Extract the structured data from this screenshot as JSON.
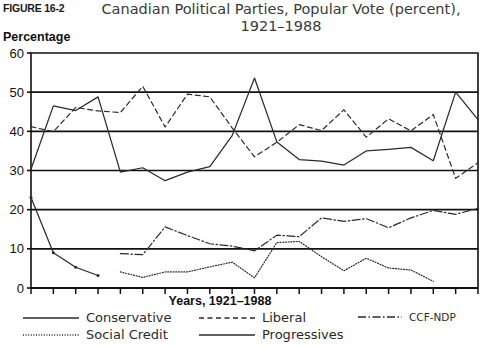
{
  "figure": {
    "number": "FIGURE 16-2",
    "title_line1": "Canadian Political Parties, Popular Vote (percent),",
    "title_line2": "1921–1988"
  },
  "axes": {
    "y_axis_label": "Percentage",
    "x_axis_label": "Years, 1921–1988",
    "y_ticks": [
      "0",
      "10",
      "20",
      "30",
      "40",
      "50",
      "60"
    ],
    "x_ticks": [
      "21",
      "25",
      "26",
      "30",
      "35",
      "40",
      "45",
      "49",
      "53",
      "57",
      "58",
      "62",
      "63",
      "65",
      "68",
      "72",
      "74",
      "79",
      "80",
      "84",
      "88"
    ]
  },
  "legend": {
    "items": [
      {
        "label": "Conservative",
        "style": "solid",
        "icon": "line-solid-icon"
      },
      {
        "label": "Social Credit",
        "style": "dotted",
        "icon": "line-dotted-icon"
      },
      {
        "label": "Liberal",
        "style": "dashed",
        "icon": "line-dashed-icon"
      },
      {
        "label": "Progressives",
        "style": "solid",
        "icon": "line-solid-icon"
      },
      {
        "label": "CCF-NDP",
        "style": "dashdot",
        "icon": "line-dashdot-icon"
      }
    ]
  },
  "chart_data": {
    "type": "line",
    "title": "Canadian Political Parties, Popular Vote (percent), 1921–1988",
    "xlabel": "Years, 1921–1988",
    "ylabel": "Percentage",
    "ylim": [
      0,
      60
    ],
    "ytick_step": 10,
    "grid": true,
    "legend_position": "bottom",
    "categories": [
      "21",
      "25",
      "26",
      "30",
      "35",
      "40",
      "45",
      "49",
      "53",
      "57",
      "58",
      "62",
      "63",
      "65",
      "68",
      "72",
      "74",
      "79",
      "80",
      "84",
      "88"
    ],
    "series": [
      {
        "name": "Conservative",
        "style": "solid",
        "color": "#2b2b2b",
        "x": [
          "21",
          "25",
          "26",
          "30",
          "35",
          "40",
          "45",
          "49",
          "53",
          "57",
          "58",
          "62",
          "63",
          "65",
          "68",
          "72",
          "74",
          "79",
          "80",
          "84",
          "88"
        ],
        "values": [
          30.3,
          46.5,
          45.3,
          48.8,
          29.6,
          30.7,
          27.4,
          29.6,
          31.0,
          38.9,
          53.6,
          37.3,
          32.8,
          32.4,
          31.4,
          35.0,
          35.4,
          35.9,
          32.5,
          50.0,
          43.0
        ]
      },
      {
        "name": "Liberal",
        "style": "dashed",
        "color": "#2b2b2b",
        "x": [
          "21",
          "25",
          "26",
          "30",
          "35",
          "40",
          "45",
          "49",
          "53",
          "57",
          "58",
          "62",
          "63",
          "65",
          "68",
          "72",
          "74",
          "79",
          "80",
          "84",
          "88"
        ],
        "values": [
          41.2,
          39.9,
          46.1,
          45.2,
          44.8,
          51.5,
          41.1,
          49.5,
          48.8,
          40.9,
          33.5,
          37.2,
          41.7,
          40.2,
          45.5,
          38.5,
          43.2,
          40.1,
          44.3,
          28.0,
          32.0
        ]
      },
      {
        "name": "CCF-NDP",
        "style": "dashdot",
        "color": "#2b2b2b",
        "x": [
          "35",
          "40",
          "45",
          "49",
          "53",
          "57",
          "58",
          "62",
          "63",
          "65",
          "68",
          "72",
          "74",
          "79",
          "80",
          "84",
          "88"
        ],
        "values": [
          8.8,
          8.5,
          15.6,
          13.4,
          11.3,
          10.7,
          9.5,
          13.5,
          13.1,
          17.9,
          17.0,
          17.7,
          15.4,
          17.9,
          19.8,
          18.8,
          20.4
        ]
      },
      {
        "name": "Social Credit",
        "style": "dotted",
        "color": "#2b2b2b",
        "x": [
          "35",
          "40",
          "45",
          "49",
          "53",
          "57",
          "58",
          "62",
          "63",
          "65",
          "68",
          "72",
          "74",
          "79",
          "80"
        ],
        "values": [
          4.1,
          2.7,
          4.1,
          4.1,
          5.4,
          6.6,
          2.6,
          11.6,
          11.9,
          8.0,
          4.4,
          7.6,
          5.1,
          4.6,
          1.7
        ]
      },
      {
        "name": "Progressives",
        "style": "solid",
        "color": "#2b2b2b",
        "x": [
          "21",
          "25",
          "26",
          "30"
        ],
        "values": [
          23.1,
          9.0,
          5.3,
          3.2
        ]
      }
    ]
  }
}
